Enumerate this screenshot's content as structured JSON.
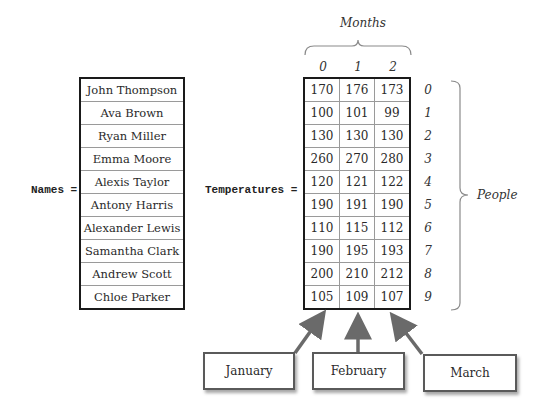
{
  "names_label": "Names =",
  "temperatures_label": "Temperatures =",
  "months_label": "Months",
  "people_label": "People",
  "names": [
    "John Thompson",
    "Ava Brown",
    "Ryan Miller",
    "Emma Moore",
    "Alexis Taylor",
    "Antony Harris",
    "Alexander Lewis",
    "Samantha Clark",
    "Andrew Scott",
    "Chloe Parker"
  ],
  "column_indices": [
    "0",
    "1",
    "2"
  ],
  "row_indices": [
    "0",
    "1",
    "2",
    "3",
    "4",
    "5",
    "6",
    "7",
    "8",
    "9"
  ],
  "temperatures": [
    [
      "170",
      "176",
      "173"
    ],
    [
      "100",
      "101",
      "99"
    ],
    [
      "130",
      "130",
      "130"
    ],
    [
      "260",
      "270",
      "280"
    ],
    [
      "120",
      "121",
      "122"
    ],
    [
      "190",
      "191",
      "190"
    ],
    [
      "110",
      "115",
      "112"
    ],
    [
      "190",
      "195",
      "193"
    ],
    [
      "200",
      "210",
      "212"
    ],
    [
      "105",
      "109",
      "107"
    ]
  ],
  "callouts": [
    "January",
    "February",
    "March"
  ],
  "colors": {
    "table_border": "#1a1a1a",
    "cell_border": "#9a9a9a",
    "arrow": "#6a6a6a",
    "brace": "#8a8a8a"
  }
}
